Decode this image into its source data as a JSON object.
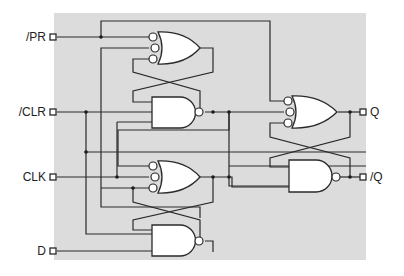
{
  "diagram": {
    "type": "logic-circuit",
    "background_color": "#dcdcdc",
    "inputs": [
      {
        "id": "pr",
        "label": "/PR"
      },
      {
        "id": "clr",
        "label": "/CLR"
      },
      {
        "id": "clk",
        "label": "CLK"
      },
      {
        "id": "d",
        "label": "D"
      }
    ],
    "outputs": [
      {
        "id": "q",
        "label": "Q"
      },
      {
        "id": "nq",
        "label": "/Q"
      }
    ],
    "gates": [
      {
        "id": "g1",
        "type": "OR with inverted inputs",
        "inputs": 3
      },
      {
        "id": "g2",
        "type": "NAND",
        "inputs": 2
      },
      {
        "id": "g3",
        "type": "OR with inverted inputs",
        "inputs": 3
      },
      {
        "id": "g4",
        "type": "NAND",
        "inputs": 2
      },
      {
        "id": "g5",
        "type": "OR with inverted inputs",
        "inputs": 3
      },
      {
        "id": "g6",
        "type": "NAND",
        "inputs": 2
      }
    ]
  }
}
